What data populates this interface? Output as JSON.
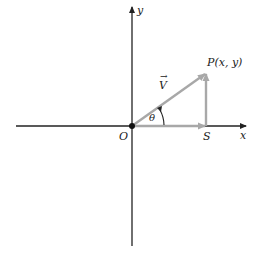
{
  "diagram": {
    "labels": {
      "y_axis": "y",
      "x_axis": "x",
      "origin": "O",
      "point_p": "P(x, y)",
      "point_s": "S",
      "vector": "V",
      "vector_arrow": "→",
      "angle": "θ"
    },
    "colors": {
      "axis": "#222222",
      "vector": "#a8a8a8",
      "origin_dot": "#111111"
    }
  }
}
